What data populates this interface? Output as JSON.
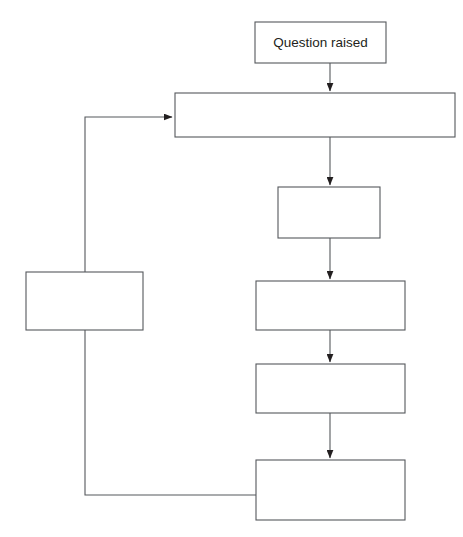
{
  "diagram": {
    "type": "flowchart",
    "background_color": "#ffffff",
    "line_color": "#55585c",
    "box_fill": "#ffffff",
    "text_color": "#231f20",
    "nodes": [
      {
        "id": "question-raised",
        "label": "Question raised",
        "x": 255,
        "y": 22,
        "w": 131,
        "h": 41
      },
      {
        "id": "stage-2",
        "label": "",
        "x": 175,
        "y": 93,
        "w": 280,
        "h": 44
      },
      {
        "id": "stage-3",
        "label": "",
        "x": 278,
        "y": 187,
        "w": 102,
        "h": 51
      },
      {
        "id": "stage-4",
        "label": "",
        "x": 256,
        "y": 281,
        "w": 149,
        "h": 49
      },
      {
        "id": "stage-5",
        "label": "",
        "x": 256,
        "y": 364,
        "w": 149,
        "h": 49
      },
      {
        "id": "stage-6",
        "label": "",
        "x": 256,
        "y": 460,
        "w": 149,
        "h": 60
      },
      {
        "id": "feedback-stage",
        "label": "",
        "x": 26,
        "y": 272,
        "w": 117,
        "h": 58
      }
    ],
    "connectors": [
      {
        "id": "question-to-stage2",
        "from": "question-raised",
        "to": "stage-2",
        "path": "M 330 63 L 330 91",
        "arrow": true
      },
      {
        "id": "stage2-to-stage3",
        "from": "stage-2",
        "to": "stage-3",
        "path": "M 330 137 L 330 185",
        "arrow": true
      },
      {
        "id": "stage3-to-stage4",
        "from": "stage-3",
        "to": "stage-4",
        "path": "M 330 238 L 330 279",
        "arrow": true
      },
      {
        "id": "stage4-to-stage5",
        "from": "stage-4",
        "to": "stage-5",
        "path": "M 330 330 L 330 362",
        "arrow": true
      },
      {
        "id": "stage5-to-stage6",
        "from": "stage-5",
        "to": "stage-6",
        "path": "M 330 413 L 330 458",
        "arrow": true
      },
      {
        "id": "feedback-loop",
        "from": "stage-6",
        "to": "stage-2",
        "path": "M 256 495 L 85 495 L 85 117 L 172 117",
        "arrow": true
      }
    ]
  }
}
